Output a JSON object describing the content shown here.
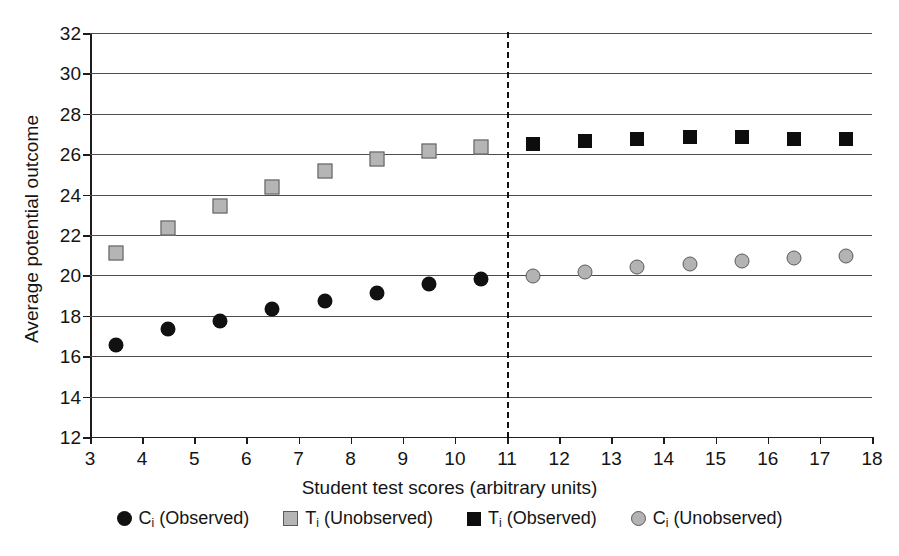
{
  "chart_data": {
    "type": "scatter",
    "title": "",
    "xlabel": "Student test scores (arbitrary units)",
    "ylabel": "Average potential outcome",
    "xlim": [
      3,
      18
    ],
    "ylim": [
      12,
      32
    ],
    "xticks": [
      3,
      4,
      5,
      6,
      7,
      8,
      9,
      10,
      11,
      12,
      13,
      14,
      15,
      16,
      17,
      18
    ],
    "yticks": [
      12,
      14,
      16,
      18,
      20,
      22,
      24,
      26,
      28,
      30,
      32
    ],
    "grid": "horizontal",
    "legend_position": "bottom",
    "annotations": [
      {
        "name": "cutoff-line",
        "type": "vertical-dashed-line",
        "x": 11,
        "color": "#111111"
      }
    ],
    "series": [
      {
        "name": "C_i (Observed)",
        "marker": "filled-circle",
        "color": "#111111",
        "x": [
          3.5,
          4.5,
          5.5,
          6.5,
          7.5,
          8.5,
          9.5,
          10.5
        ],
        "values": [
          16.55,
          17.35,
          17.75,
          18.35,
          18.75,
          19.15,
          19.55,
          19.8
        ]
      },
      {
        "name": "T_i (Unobserved)",
        "marker": "gray-square",
        "color": "#b5b5b5",
        "x": [
          3.5,
          4.5,
          5.5,
          6.5,
          7.5,
          8.5,
          9.5,
          10.5
        ],
        "values": [
          21.1,
          22.35,
          23.45,
          24.4,
          25.15,
          25.75,
          26.15,
          26.35
        ]
      },
      {
        "name": "T_i (Observed)",
        "marker": "filled-square",
        "color": "#0d0d0d",
        "x": [
          11.5,
          12.5,
          13.5,
          14.5,
          15.5,
          16.5,
          17.5
        ],
        "values": [
          26.5,
          26.65,
          26.75,
          26.85,
          26.85,
          26.75,
          26.75
        ]
      },
      {
        "name": "C_i (Unobserved)",
        "marker": "gray-circle",
        "color": "#b3b3b3",
        "x": [
          11.5,
          12.5,
          13.5,
          14.5,
          15.5,
          16.5,
          17.5
        ],
        "values": [
          19.95,
          20.15,
          20.4,
          20.55,
          20.7,
          20.85,
          20.95
        ]
      }
    ]
  },
  "axes": {
    "x_title": "Student test scores (arbitrary units)",
    "y_title": "Average potential outcome"
  },
  "legend": {
    "items": [
      {
        "symbol_name": "black-circle-swatch",
        "base": "C",
        "sub": "i",
        "suffix": " (Observed)"
      },
      {
        "symbol_name": "gray-square-swatch",
        "base": "T",
        "sub": "i",
        "suffix": " (Unobserved)"
      },
      {
        "symbol_name": "black-square-swatch",
        "base": "T",
        "sub": "i",
        "suffix": " (Observed)"
      },
      {
        "symbol_name": "gray-circle-swatch",
        "base": "C",
        "sub": "i",
        "suffix": " (Unobserved)"
      }
    ]
  },
  "colors": {
    "black": "#111111",
    "gray_fill": "#b5b5b5",
    "gray_edge": "#5a5a5a",
    "gridline": "#4c4c4c",
    "axis": "#1c1c1c",
    "background": "#ffffff"
  }
}
